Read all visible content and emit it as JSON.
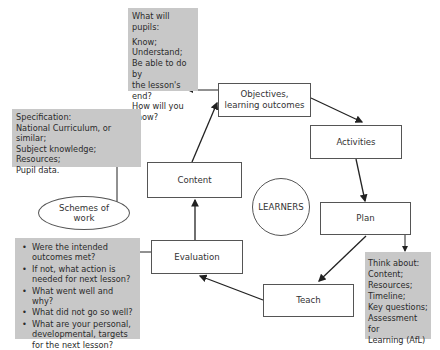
{
  "diagram": {
    "center": {
      "label": "LEARNERS"
    },
    "cycle_nodes": [
      {
        "id": "objectives",
        "label": "Objectives, learning outcomes",
        "lines": [
          "Objectives,",
          "learning outcomes"
        ]
      },
      {
        "id": "activities",
        "label": "Activities"
      },
      {
        "id": "plan",
        "label": "Plan"
      },
      {
        "id": "teach",
        "label": "Teach"
      },
      {
        "id": "evaluation",
        "label": "Evaluation"
      },
      {
        "id": "content",
        "label": "Content"
      }
    ],
    "cycle_edges": [
      [
        "objectives",
        "activities"
      ],
      [
        "activities",
        "plan"
      ],
      [
        "plan",
        "teach"
      ],
      [
        "teach",
        "evaluation"
      ],
      [
        "evaluation",
        "content"
      ],
      [
        "content",
        "objectives"
      ]
    ],
    "side_nodes": {
      "pupils_box": {
        "heading": "What will pupils:",
        "lines": [
          "Know;",
          "Understand;",
          "Be able to do by",
          "the lesson's end?",
          "How will you",
          "know?"
        ],
        "linked_from": "objectives"
      },
      "specification_box": {
        "lines": [
          "Specification:",
          "National Curriculum, or similar;",
          "Subject knowledge;",
          "Resources;",
          "Pupil data."
        ],
        "linked_to": "schemes"
      },
      "schemes": {
        "lines": [
          "Schemes of",
          "work"
        ]
      },
      "evaluation_box": {
        "bullets": [
          "Were the intended outcomes met?",
          "If not, what action is needed for next lesson?",
          "What went well and why?",
          "What did not go so well?",
          "What are your personal, developmental, targets for the next lesson?"
        ],
        "linked_from": "evaluation"
      },
      "think_box": {
        "lines": [
          "Think about:",
          "Content;",
          "Resources;",
          "Timeline;",
          "Key questions;",
          "Assessment for",
          "Learning (AfL)"
        ],
        "linked_from": "plan"
      }
    },
    "colors": {
      "gray_box": "#c8c8c8",
      "border": "#555555",
      "arrow": "#222222",
      "background": "#ffffff"
    }
  }
}
